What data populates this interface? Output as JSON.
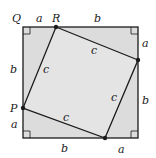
{
  "diagram": {
    "colors": {
      "outer_fill": "#dcdcdc",
      "inner_fill": "#e6e6e6",
      "stroke": "#1a1a1a",
      "background": "#ffffff"
    },
    "points": {
      "Q": "Q",
      "R": "R",
      "P": "P"
    },
    "top_labels": {
      "left": "a",
      "right": "b"
    },
    "right_labels": {
      "top": "a",
      "bottom": "b"
    },
    "bottom_labels": {
      "left": "b",
      "right": "a"
    },
    "left_labels": {
      "top": "b",
      "bottom": "a"
    },
    "inner_labels": {
      "top": "c",
      "right": "c",
      "bottom": "c",
      "left": "c"
    }
  }
}
